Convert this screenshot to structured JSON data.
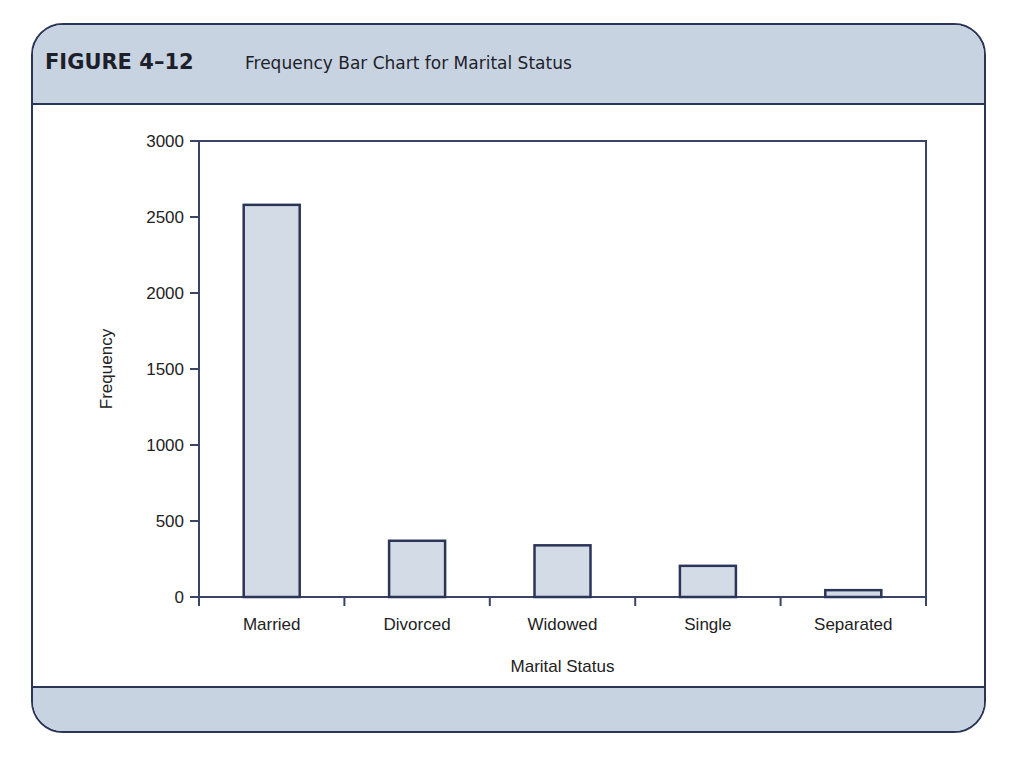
{
  "figure": {
    "label": "FIGURE 4–12",
    "title": "Frequency Bar Chart for Marital Status"
  },
  "colors": {
    "frame_border": "#2b3558",
    "header_fill": "#c8d3e2",
    "bar_fill": "#d3dbe7",
    "bar_stroke": "#2b3558",
    "axis": "#3b4466"
  },
  "chart_data": {
    "type": "bar",
    "title": "Frequency Bar Chart for Marital Status",
    "xlabel": "Marital Status",
    "ylabel": "Frequency",
    "categories": [
      "Married",
      "Divorced",
      "Widowed",
      "Single",
      "Separated"
    ],
    "values": [
      2580,
      370,
      340,
      205,
      45
    ],
    "ylim": [
      0,
      3000
    ],
    "yticks": [
      0,
      500,
      1000,
      1500,
      2000,
      2500,
      3000
    ],
    "grid": false,
    "legend": null
  }
}
